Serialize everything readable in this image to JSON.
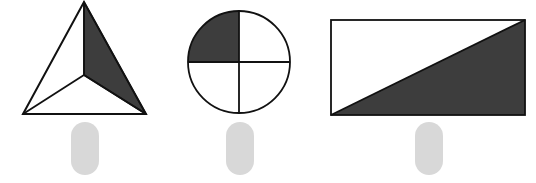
{
  "colors": {
    "stroke": "#111111",
    "shade": "#3d3d3d",
    "fill": "#ffffff",
    "pill": "#d8d8d8"
  },
  "figures": [
    {
      "name": "triangle",
      "description": "Triangle divided into 3 equal parts from center, 1 shaded",
      "parts": 3,
      "shaded": 1,
      "answer_box": ""
    },
    {
      "name": "circle",
      "description": "Circle divided into 4 equal quarters, 1 shaded",
      "parts": 4,
      "shaded": 1,
      "answer_box": ""
    },
    {
      "name": "rectangle",
      "description": "Rectangle divided by a diagonal into 2 equal parts, 1 shaded",
      "parts": 2,
      "shaded": 1,
      "answer_box": ""
    }
  ]
}
